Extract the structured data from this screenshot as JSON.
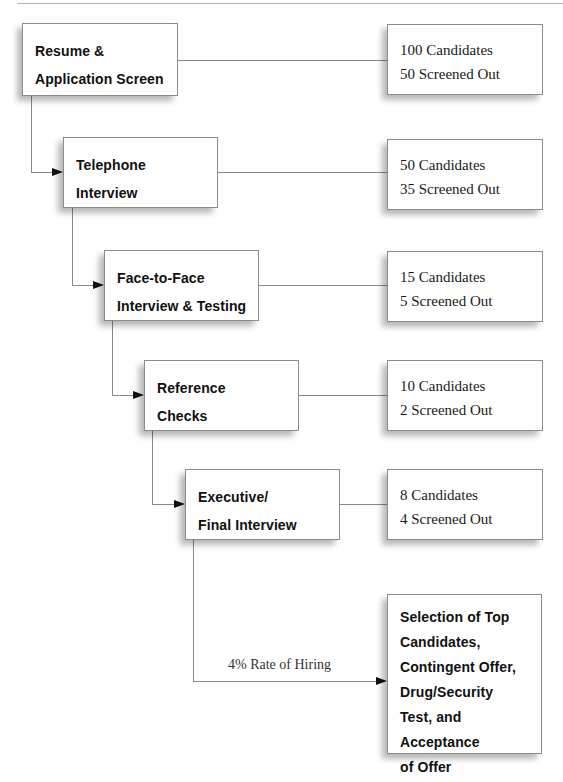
{
  "stages": [
    {
      "lines": [
        "Resume &",
        "Application Screen"
      ]
    },
    {
      "lines": [
        "Telephone",
        "Interview"
      ]
    },
    {
      "lines": [
        "Face-to-Face",
        "Interview & Testing"
      ]
    },
    {
      "lines": [
        "Reference",
        "Checks"
      ]
    },
    {
      "lines": [
        "Executive/",
        "Final Interview"
      ]
    }
  ],
  "results": [
    {
      "candidates": "100 Candidates",
      "screened_out": "50 Screened Out"
    },
    {
      "candidates": "50 Candidates",
      "screened_out": "35 Screened Out"
    },
    {
      "candidates": "15 Candidates",
      "screened_out": "5 Screened Out"
    },
    {
      "candidates": "10 Candidates",
      "screened_out": "2 Screened Out"
    },
    {
      "candidates": "8 Candidates",
      "screened_out": "4 Screened Out"
    }
  ],
  "final": {
    "lines": [
      "Selection of Top",
      "Candidates,",
      "Contingent Offer,",
      "Drug/Security",
      "Test, and Acceptance",
      "of Offer"
    ]
  },
  "hiring_rate_label": "4% Rate of Hiring"
}
